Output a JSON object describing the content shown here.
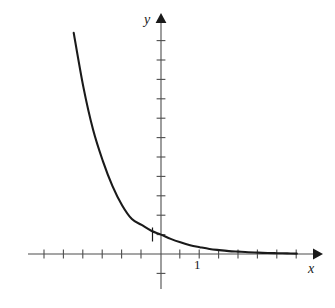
{
  "figure": {
    "name": "exponential-decay-graph",
    "background_color": "#ffffff",
    "curve_color": "#1a1a1a",
    "axis_color": "#4d4d4d"
  },
  "labels": {
    "y_axis": "y",
    "x_axis": "x",
    "x_tick_1": "1",
    "y_tick_1": "1"
  },
  "chart_data": {
    "type": "line",
    "title": "",
    "subtitle": "",
    "xlabel": "x",
    "ylabel": "y",
    "grid": false,
    "legend": null,
    "annotations": [],
    "axes": {
      "origin_px": [
        161,
        254
      ],
      "unit_px": 19.4,
      "x_axis_y_px": 254,
      "y_axis_x_px": 161,
      "x_tick_values": [
        -6,
        -5,
        -4,
        -3,
        -2,
        -1,
        1,
        2,
        3,
        4,
        5,
        6,
        7
      ],
      "y_tick_values": [
        -1,
        1,
        2,
        3,
        4,
        5,
        6,
        7,
        8,
        9,
        10
      ],
      "x_tick_labels": {
        "1": "1"
      },
      "y_tick_labels": {
        "1": "1"
      },
      "xlim": [
        -6.9,
        8.2
      ],
      "ylim": [
        -1.8,
        11.9
      ],
      "x_arrow": true,
      "y_arrow": true
    },
    "series": [
      {
        "name": "exponential decay",
        "equation": "y = b^(-x)",
        "base": 2.9,
        "x": [
          -4.5,
          -4.0,
          -3.5,
          -3.0,
          -2.5,
          -2.0,
          -1.5,
          -1.0,
          -0.5,
          0.0,
          0.5,
          1.0,
          1.5,
          2.0,
          2.5,
          3.0,
          3.5,
          4.0,
          4.5,
          5.0,
          5.5,
          6.0,
          6.5,
          7.0
        ],
        "y": [
          11.4,
          8.6,
          6.4,
          4.8,
          3.5,
          2.5,
          1.8,
          1.5,
          1.2,
          1.0,
          0.78,
          0.6,
          0.45,
          0.35,
          0.26,
          0.2,
          0.15,
          0.12,
          0.09,
          0.07,
          0.05,
          0.04,
          0.03,
          0.02
        ]
      }
    ]
  }
}
